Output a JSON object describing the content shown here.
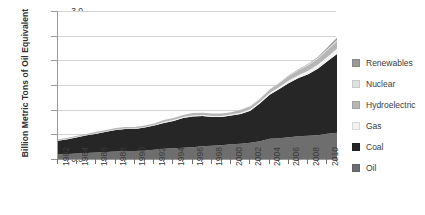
{
  "chart_data": {
    "type": "area",
    "stacked": true,
    "title": "",
    "subtitle": "",
    "xlabel": "",
    "ylabel": "Billion Metric Tons of Oil Equivalent",
    "ylim": [
      0.0,
      3.0
    ],
    "ytick_labels": [
      "0.0",
      "0.5",
      "1.0",
      "1.5",
      "2.0",
      "2.5",
      "3.0"
    ],
    "ytick_values": [
      0.0,
      0.5,
      1.0,
      1.5,
      2.0,
      2.5,
      3.0
    ],
    "xlim": [
      1982,
      2011
    ],
    "x": [
      1982,
      1983,
      1984,
      1985,
      1986,
      1987,
      1988,
      1989,
      1990,
      1991,
      1992,
      1993,
      1994,
      1995,
      1996,
      1997,
      1998,
      1999,
      2000,
      2001,
      2002,
      2003,
      2004,
      2005,
      2006,
      2007,
      2008,
      2009,
      2010,
      2011
    ],
    "xtick_labels": [
      "1982",
      "1984",
      "1986",
      "1988",
      "1990",
      "1992",
      "1994",
      "1996",
      "1998",
      "2000",
      "2002",
      "2004",
      "2006",
      "2008",
      "2010"
    ],
    "xtick_values": [
      1982,
      1984,
      1986,
      1988,
      1990,
      1992,
      1994,
      1996,
      1998,
      2000,
      2002,
      2004,
      2006,
      2008,
      2010
    ],
    "grid": "horizontal",
    "legend_position": "right",
    "stack_order_bottom_to_top": [
      "Oil",
      "Coal",
      "Gas",
      "Hydroelectric",
      "Nuclear",
      "Renewables"
    ],
    "series": [
      {
        "name": "Oil",
        "color": "#6e6e6e",
        "values": [
          0.09,
          0.1,
          0.11,
          0.12,
          0.13,
          0.14,
          0.15,
          0.16,
          0.16,
          0.17,
          0.19,
          0.21,
          0.22,
          0.23,
          0.24,
          0.26,
          0.27,
          0.28,
          0.3,
          0.31,
          0.33,
          0.36,
          0.41,
          0.42,
          0.44,
          0.46,
          0.47,
          0.48,
          0.51,
          0.53
        ]
      },
      {
        "name": "Coal",
        "color": "#262626",
        "values": [
          0.28,
          0.3,
          0.33,
          0.36,
          0.38,
          0.41,
          0.44,
          0.45,
          0.45,
          0.47,
          0.49,
          0.52,
          0.55,
          0.6,
          0.62,
          0.61,
          0.58,
          0.57,
          0.58,
          0.6,
          0.65,
          0.77,
          0.89,
          1.0,
          1.1,
          1.18,
          1.25,
          1.35,
          1.47,
          1.6
        ]
      },
      {
        "name": "Gas",
        "color": "#f2f2f2",
        "values": [
          0.01,
          0.01,
          0.01,
          0.01,
          0.01,
          0.01,
          0.01,
          0.01,
          0.01,
          0.01,
          0.01,
          0.02,
          0.02,
          0.02,
          0.02,
          0.02,
          0.02,
          0.02,
          0.02,
          0.03,
          0.03,
          0.03,
          0.04,
          0.04,
          0.05,
          0.06,
          0.07,
          0.08,
          0.09,
          0.11
        ]
      },
      {
        "name": "Hydroelectric",
        "color": "#b6b6b6",
        "values": [
          0.02,
          0.02,
          0.02,
          0.02,
          0.03,
          0.03,
          0.03,
          0.03,
          0.03,
          0.03,
          0.03,
          0.04,
          0.04,
          0.04,
          0.05,
          0.05,
          0.05,
          0.05,
          0.05,
          0.06,
          0.06,
          0.06,
          0.07,
          0.08,
          0.09,
          0.1,
          0.11,
          0.12,
          0.14,
          0.15
        ]
      },
      {
        "name": "Nuclear",
        "color": "#e0e0e0",
        "values": [
          0.0,
          0.0,
          0.0,
          0.0,
          0.0,
          0.0,
          0.0,
          0.0,
          0.0,
          0.0,
          0.0,
          0.0,
          0.0,
          0.0,
          0.0,
          0.0,
          0.0,
          0.0,
          0.0,
          0.01,
          0.01,
          0.01,
          0.01,
          0.01,
          0.01,
          0.01,
          0.02,
          0.02,
          0.02,
          0.02
        ]
      },
      {
        "name": "Renewables",
        "color": "#999999",
        "values": [
          0.0,
          0.0,
          0.0,
          0.0,
          0.0,
          0.0,
          0.0,
          0.0,
          0.0,
          0.0,
          0.0,
          0.0,
          0.0,
          0.0,
          0.0,
          0.0,
          0.0,
          0.0,
          0.0,
          0.0,
          0.0,
          0.0,
          0.0,
          0.0,
          0.01,
          0.01,
          0.01,
          0.02,
          0.03,
          0.05
        ]
      }
    ]
  },
  "legend": {
    "items": [
      {
        "label": "Renewables",
        "color": "#999999"
      },
      {
        "label": "Nuclear",
        "color": "#e0e0e0"
      },
      {
        "label": "Hydroelectric",
        "color": "#b6b6b6"
      },
      {
        "label": "Gas",
        "color": "#f2f2f2"
      },
      {
        "label": "Coal",
        "color": "#262626"
      },
      {
        "label": "Oil",
        "color": "#6e6e6e"
      }
    ]
  }
}
